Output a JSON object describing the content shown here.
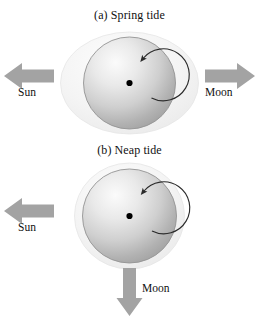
{
  "figure": {
    "background_color": "#ffffff"
  },
  "panels": [
    {
      "id": "spring",
      "caption": "(a) Spring tide",
      "earth_label": "earth",
      "tidal_bulge_shape": "horizontal-ellipse",
      "rotation_arrow": "counterclockwise",
      "arrows": [
        {
          "direction": "left",
          "label": "Sun"
        },
        {
          "direction": "right",
          "label": "Moon"
        }
      ]
    },
    {
      "id": "neap",
      "caption": "(b) Neap tide",
      "earth_label": "earth",
      "tidal_bulge_shape": "near-circle",
      "rotation_arrow": "counterclockwise",
      "arrows": [
        {
          "direction": "left",
          "label": "Sun"
        },
        {
          "direction": "down",
          "label": "Moon"
        }
      ]
    }
  ],
  "labels": {
    "sun": "Sun",
    "moon": "Moon"
  },
  "colors": {
    "arrow_gray": "#a3a3a3",
    "ocean_bulge": "#f1f1f1",
    "ocean_bulge_edge": "#e2e2e2",
    "earth_light": "#f4f4f4",
    "earth_dark": "#a8a8a8",
    "earth_outline": "#8f8f8f",
    "rotation_arrow": "#2b2b2b",
    "center_dot": "#000000",
    "text": "#111111"
  }
}
